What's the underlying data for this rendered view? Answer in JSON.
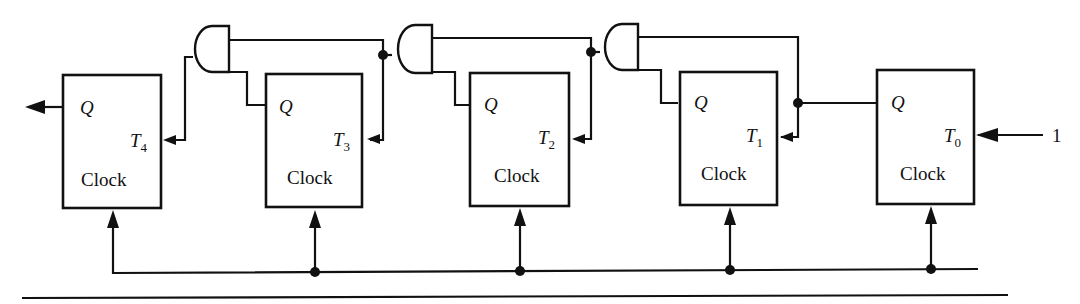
{
  "diagram": {
    "flipflops": [
      {
        "id": "ff4",
        "q_label": "Q",
        "t_label": "T",
        "t_sub": "4",
        "clock_label": "Clock"
      },
      {
        "id": "ff3",
        "q_label": "Q",
        "t_label": "T",
        "t_sub": "3",
        "clock_label": "Clock"
      },
      {
        "id": "ff2",
        "q_label": "Q",
        "t_label": "T",
        "t_sub": "2",
        "clock_label": "Clock"
      },
      {
        "id": "ff1",
        "q_label": "Q",
        "t_label": "T",
        "t_sub": "1",
        "clock_label": "Clock"
      },
      {
        "id": "ff0",
        "q_label": "Q",
        "t_label": "T",
        "t_sub": "0",
        "clock_label": "Clock"
      }
    ],
    "gates": [
      {
        "id": "and3",
        "type": "AND"
      },
      {
        "id": "and2",
        "type": "AND"
      },
      {
        "id": "and1",
        "type": "AND"
      }
    ],
    "input_label": "1",
    "colors": {
      "line": "#111111",
      "background": "#ffffff"
    }
  }
}
